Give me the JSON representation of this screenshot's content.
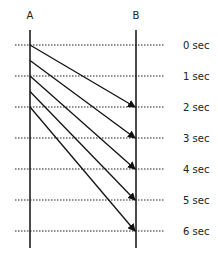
{
  "diagram": {
    "participants": [
      {
        "id": "A",
        "label": "A"
      },
      {
        "id": "B",
        "label": "B"
      }
    ],
    "time_unit": "sec",
    "time_labels": [
      "0 sec",
      "1 sec",
      "2 sec",
      "3 sec",
      "4 sec",
      "5 sec",
      "6 sec"
    ],
    "time_ticks": [
      0,
      1,
      2,
      3,
      4,
      5,
      6
    ],
    "messages": [
      {
        "from": "A",
        "to": "B",
        "send_time": 0.0,
        "arrive_time": 2
      },
      {
        "from": "A",
        "to": "B",
        "send_time": 0.5,
        "arrive_time": 3
      },
      {
        "from": "A",
        "to": "B",
        "send_time": 1.0,
        "arrive_time": 4
      },
      {
        "from": "A",
        "to": "B",
        "send_time": 1.5,
        "arrive_time": 5
      },
      {
        "from": "A",
        "to": "B",
        "send_time": 2.0,
        "arrive_time": 6
      }
    ],
    "colors": {
      "line": "#111111",
      "grid": "#222222",
      "text": "#222222"
    }
  }
}
